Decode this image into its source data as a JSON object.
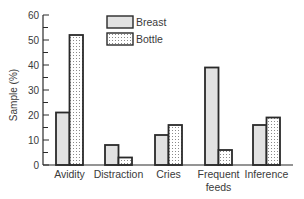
{
  "chart_data": {
    "type": "bar",
    "title": "",
    "xlabel": "",
    "ylabel": "Sample (%)",
    "ylim": [
      0,
      60
    ],
    "yticks": [
      0,
      10,
      20,
      30,
      40,
      50,
      60
    ],
    "grid": false,
    "legend_position": "top-center",
    "categories": [
      "Avidity",
      "Distraction",
      "Cries",
      "Frequent feeds",
      "Inference"
    ],
    "category_label_lines": [
      [
        "Avidity"
      ],
      [
        "Distraction"
      ],
      [
        "Cries"
      ],
      [
        "Frequent",
        "feeds"
      ],
      [
        "Inference"
      ]
    ],
    "series": [
      {
        "name": "Breast",
        "values": [
          21,
          8,
          12,
          39,
          16
        ],
        "fill": "#e2e2e2",
        "pattern": "solid"
      },
      {
        "name": "Bottle",
        "values": [
          52,
          3,
          16,
          6,
          19
        ],
        "fill": "#ffffff",
        "pattern": "dotted"
      }
    ]
  },
  "colors": {
    "stroke": "#2a2a2a",
    "text": "#3a3a3a",
    "breast_fill": "#e2e2e2",
    "dot": "#8a8a8a"
  }
}
